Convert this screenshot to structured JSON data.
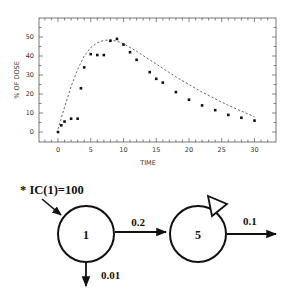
{
  "chart_data": {
    "type": "scatter",
    "title": "",
    "xlabel": "TIME",
    "ylabel": "% OF DOSE",
    "xlim": [
      -3,
      33
    ],
    "ylim": [
      -3,
      57
    ],
    "x_ticks": [
      0,
      5,
      10,
      15,
      20,
      25,
      30
    ],
    "y_ticks": [
      0,
      10,
      20,
      30,
      40,
      50
    ],
    "grid": false,
    "legend": null,
    "series": [
      {
        "name": "observed",
        "style": "points",
        "x": [
          0,
          0.5,
          1,
          2,
          3,
          3.5,
          4,
          5,
          6,
          7,
          8,
          9,
          10,
          11,
          12,
          14,
          15,
          16,
          18,
          20,
          22,
          24,
          26,
          28,
          30
        ],
        "y": [
          0,
          3.5,
          5.5,
          7,
          7,
          23,
          34,
          41,
          40.5,
          40.5,
          48,
          49,
          46,
          42,
          38,
          31.5,
          28,
          26,
          21,
          17,
          14,
          11.5,
          9,
          7.5,
          6
        ]
      },
      {
        "name": "model fit",
        "style": "dashed-line",
        "x": [
          0,
          1,
          2,
          3,
          4,
          5,
          6,
          7,
          8,
          9,
          10,
          12,
          14,
          16,
          18,
          20,
          22,
          24,
          26,
          28,
          30
        ],
        "y": [
          1.5,
          13,
          24,
          33,
          40,
          44.5,
          47,
          48.2,
          48.5,
          47.8,
          46.5,
          42.5,
          38,
          33.5,
          29,
          25,
          21,
          17.5,
          14,
          11,
          8
        ]
      }
    ]
  },
  "diagram": {
    "initial_condition": "* IC(1)=100",
    "compartments": [
      {
        "id": "1",
        "label": "1"
      },
      {
        "id": "5",
        "label": "5",
        "sampled": true
      }
    ],
    "flows": [
      {
        "from": "1",
        "to": "5",
        "rate": "0.2"
      },
      {
        "from": "1",
        "to": "out",
        "rate": "0.01"
      },
      {
        "from": "5",
        "to": "out",
        "rate": "0.1"
      }
    ]
  }
}
